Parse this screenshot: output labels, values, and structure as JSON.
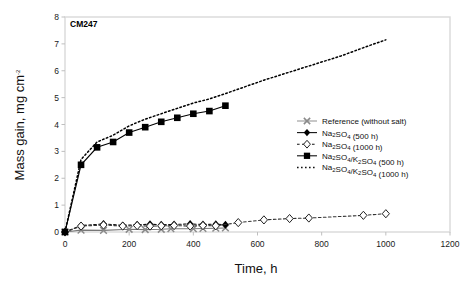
{
  "chart_data": {
    "type": "line",
    "title": "",
    "panel_label": "CM247",
    "xlabel": "Time, h",
    "ylabel": "Mass gain, mg cm-2",
    "ylabel_parts": {
      "main": "Mass gain, mg cm",
      "superscript": "-2"
    },
    "xlim": [
      0,
      1200
    ],
    "ylim": [
      0,
      8
    ],
    "xticks": [
      0,
      200,
      400,
      600,
      800,
      1000,
      1200
    ],
    "yticks": [
      0,
      1,
      2,
      3,
      4,
      5,
      6,
      7,
      8
    ],
    "grid": false,
    "legend_position": "center-right",
    "series": [
      {
        "name": "Reference (without salt)",
        "marker": "x-cross",
        "line": "solid",
        "color": "#777777",
        "x": [
          0,
          50,
          120,
          200,
          250,
          300,
          330,
          400,
          430,
          470,
          500
        ],
        "y": [
          0.0,
          0.07,
          0.06,
          0.1,
          0.09,
          0.1,
          0.12,
          0.12,
          0.13,
          0.14,
          0.15
        ]
      },
      {
        "name": "Na2SO4 (500 h)",
        "marker": "filled-diamond",
        "line": "dashed",
        "color": "#111111",
        "x": [
          0,
          50,
          120,
          180,
          225,
          265,
          300,
          340,
          390,
          430,
          470,
          500
        ],
        "y": [
          0.0,
          0.24,
          0.3,
          0.25,
          0.27,
          0.29,
          0.27,
          0.28,
          0.3,
          0.28,
          0.29,
          0.27
        ]
      },
      {
        "name": "Na2SO4 (1000 h)",
        "marker": "open-diamond",
        "line": "dashed",
        "color": "#333333",
        "x": [
          0,
          50,
          120,
          180,
          225,
          265,
          300,
          340,
          390,
          430,
          470,
          540,
          620,
          700,
          760,
          930,
          1000
        ],
        "y": [
          0.0,
          0.22,
          0.26,
          0.22,
          0.24,
          0.22,
          0.23,
          0.24,
          0.22,
          0.24,
          0.23,
          0.35,
          0.45,
          0.5,
          0.52,
          0.62,
          0.68
        ]
      },
      {
        "name": "Na2SO4/K2SO4 (500 h)",
        "marker": "filled-square",
        "line": "solid",
        "color": "#000000",
        "x": [
          0,
          50,
          100,
          150,
          200,
          250,
          300,
          350,
          400,
          450,
          500
        ],
        "y": [
          0.0,
          2.5,
          3.15,
          3.35,
          3.7,
          3.9,
          4.1,
          4.25,
          4.4,
          4.5,
          4.7
        ]
      },
      {
        "name": "Na2SO4/K2SO4 (1000 h)",
        "marker": "none",
        "line": "dotted",
        "color": "#000000",
        "x": [
          0,
          50,
          100,
          150,
          200,
          250,
          300,
          350,
          400,
          450,
          500,
          560,
          620,
          700,
          780,
          860,
          940,
          1000
        ],
        "y": [
          0.0,
          2.7,
          3.35,
          3.6,
          3.95,
          4.2,
          4.4,
          4.6,
          4.8,
          4.95,
          5.15,
          5.4,
          5.65,
          5.95,
          6.25,
          6.55,
          6.9,
          7.15
        ]
      }
    ]
  },
  "legend": {
    "entries": [
      {
        "label": "Reference (without salt)",
        "marker": "x-cross",
        "line": "solid"
      },
      {
        "label": "Na2SO4 (500 h)",
        "marker": "filled-diamond",
        "line": "solid"
      },
      {
        "label": "Na2SO4 (1000 h)",
        "marker": "open-diamond",
        "line": "dashed"
      },
      {
        "label": "Na2SO4/K2SO4 (500 h)",
        "marker": "filled-square",
        "line": "solid"
      },
      {
        "label": "Na2SO4/K2SO4 (1000 h)",
        "marker": "none",
        "line": "dotted"
      }
    ]
  },
  "axis": {
    "x_tick_labels": [
      "0",
      "200",
      "400",
      "600",
      "800",
      "1000",
      "1200"
    ],
    "y_tick_labels": [
      "0",
      "1",
      "2",
      "3",
      "4",
      "5",
      "6",
      "7",
      "8"
    ],
    "x_title": "Time, h",
    "y_title_main": "Mass gain, mg cm",
    "y_title_sup": "-2"
  },
  "colors": {
    "frame": "#d9d9d9",
    "text": "#111111",
    "reference": "#888888",
    "series_dark": "#000000"
  }
}
